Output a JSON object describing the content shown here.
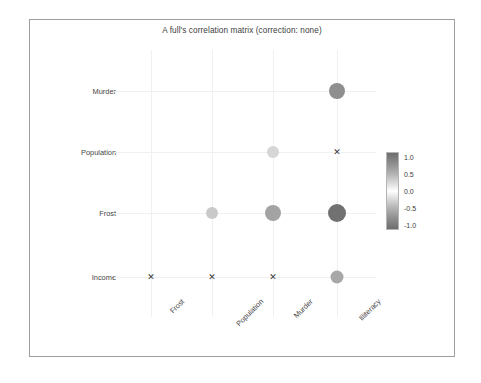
{
  "figure": {
    "title": "A full's correlation matrix (correction: none)",
    "background": "#ffffff",
    "frame_color": "#9e9e9e"
  },
  "chart_data": {
    "type": "heatmap",
    "title": "A full's correlation matrix (correction: none)",
    "subtitle": "",
    "xlabel": "",
    "ylabel": "",
    "grid": true,
    "legend_position": "right",
    "x_categories": [
      "Frost",
      "Population",
      "Murder",
      "Illiteracy"
    ],
    "y_categories": [
      "Murder",
      "Population",
      "Frost",
      "Income"
    ],
    "colorbar": {
      "ticks": [
        "1.0",
        "0.5",
        "0.0",
        "-0.5",
        "-1.0"
      ],
      "values": [
        1.0,
        0.5,
        0.0,
        -0.5,
        -1.0
      ],
      "min": -1.0,
      "max": 1.0,
      "colormap": "grayscale-diverging",
      "color_high": "#6d6d6d",
      "color_mid": "#ffffff",
      "color_low": "#6d6d6d"
    },
    "cells": [
      {
        "row": "Murder",
        "col": "Frost",
        "marker": "none"
      },
      {
        "row": "Murder",
        "col": "Population",
        "marker": "none"
      },
      {
        "row": "Murder",
        "col": "Murder",
        "marker": "none"
      },
      {
        "row": "Murder",
        "col": "Illiteracy",
        "marker": "circle",
        "value": 0.7,
        "size": 16,
        "color": "#8f8f8f"
      },
      {
        "row": "Population",
        "col": "Frost",
        "marker": "none"
      },
      {
        "row": "Population",
        "col": "Population",
        "marker": "none"
      },
      {
        "row": "Population",
        "col": "Murder",
        "marker": "circle",
        "value": 0.34,
        "size": 12,
        "color": "#d6d6d6"
      },
      {
        "row": "Population",
        "col": "Illiteracy",
        "marker": "cross",
        "size": 9
      },
      {
        "row": "Frost",
        "col": "Frost",
        "marker": "none"
      },
      {
        "row": "Frost",
        "col": "Population",
        "marker": "circle",
        "value": -0.33,
        "size": 12,
        "color": "#c9c9c9"
      },
      {
        "row": "Frost",
        "col": "Murder",
        "marker": "circle",
        "value": -0.54,
        "size": 16,
        "color": "#a3a3a3"
      },
      {
        "row": "Frost",
        "col": "Illiteracy",
        "marker": "circle",
        "value": -0.67,
        "size": 18,
        "color": "#717171"
      },
      {
        "row": "Income",
        "col": "Frost",
        "marker": "cross",
        "size": 9
      },
      {
        "row": "Income",
        "col": "Population",
        "marker": "cross",
        "size": 9
      },
      {
        "row": "Income",
        "col": "Murder",
        "marker": "cross",
        "size": 9
      },
      {
        "row": "Income",
        "col": "Illiteracy",
        "marker": "circle",
        "value": -0.44,
        "size": 13,
        "color": "#a8a8a8"
      }
    ]
  }
}
